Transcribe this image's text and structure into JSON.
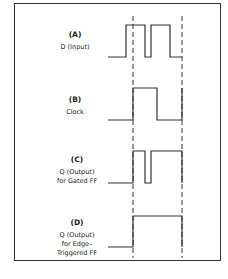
{
  "diagram": {
    "panels": [
      {
        "id": "A",
        "letter": "(A)",
        "lines": [
          "D (Input)"
        ]
      },
      {
        "id": "B",
        "letter": "(B)",
        "lines": [
          "Clock"
        ]
      },
      {
        "id": "C",
        "letter": "(C)",
        "lines": [
          "Q (Output)",
          "for Gated FF"
        ]
      },
      {
        "id": "D",
        "letter": "(D)",
        "lines": [
          "Q (Output)",
          "for Edge–",
          "Triggered FF"
        ]
      }
    ],
    "colors": {
      "line": "#333333",
      "border": "#333333",
      "background": "#ffffff"
    }
  }
}
